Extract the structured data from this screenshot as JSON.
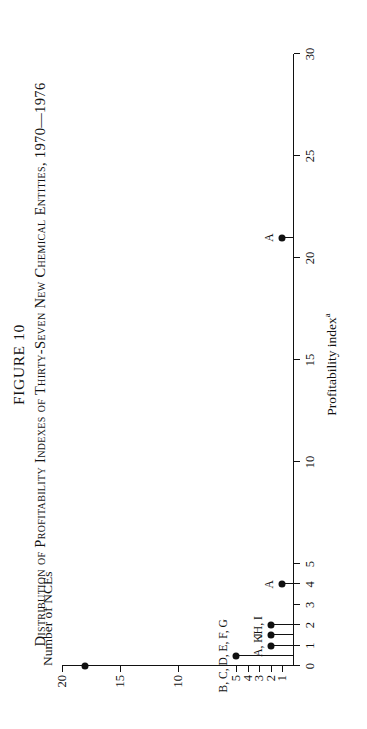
{
  "figure": {
    "number": "FIGURE 10",
    "caption": "Distribution of Profitability Indexes of Thirty-Seven New Chemical Entities, 1970—1976",
    "y_axis_title": "Number of NCEs",
    "x_axis_title_main": "Profitability index",
    "x_axis_title_super": "a"
  },
  "chart_data": {
    "type": "bar",
    "title": "Distribution of Profitability Indexes of Thirty-Seven New Chemical Entities, 1970—1976",
    "xlabel": "Profitability index",
    "ylabel": "Number of NCEs",
    "xlim": [
      0,
      30
    ],
    "ylim": [
      0,
      20
    ],
    "grid": false,
    "legend": "none",
    "orientation": "page-rotated-90-ccw",
    "xticks": [
      0,
      1,
      2,
      3,
      4,
      5,
      10,
      15,
      20,
      25,
      30
    ],
    "xticklabels": [
      "0",
      "1",
      "2",
      "3",
      "4",
      "5",
      "10",
      "15",
      "20",
      "25",
      "30"
    ],
    "yticks": [
      1,
      2,
      3,
      4,
      5,
      10,
      15,
      20
    ],
    "yticklabels": [
      "1",
      "2",
      "3",
      "4",
      "5",
      "10",
      "15",
      "20"
    ],
    "x": [
      0,
      0.5,
      1,
      1.5,
      2,
      4,
      21
    ],
    "values": [
      18,
      5,
      2,
      2,
      2,
      1,
      1
    ],
    "point_labels": [
      "",
      "B, C, D, E, F, G",
      "A, K",
      "J",
      "H, I",
      "A",
      "A"
    ],
    "points": [
      {
        "x": 0,
        "y": 18,
        "label": ""
      },
      {
        "x": 0.5,
        "y": 5,
        "label": "B, C, D, E, F, G"
      },
      {
        "x": 1,
        "y": 2,
        "label": "A, K"
      },
      {
        "x": 1.5,
        "y": 2,
        "label": "J"
      },
      {
        "x": 2,
        "y": 2,
        "label": "H, I"
      },
      {
        "x": 4,
        "y": 1,
        "label": "A"
      },
      {
        "x": 21,
        "y": 1,
        "label": "A"
      }
    ]
  },
  "colors": {
    "ink": "#111111",
    "paper": "#ffffff"
  }
}
